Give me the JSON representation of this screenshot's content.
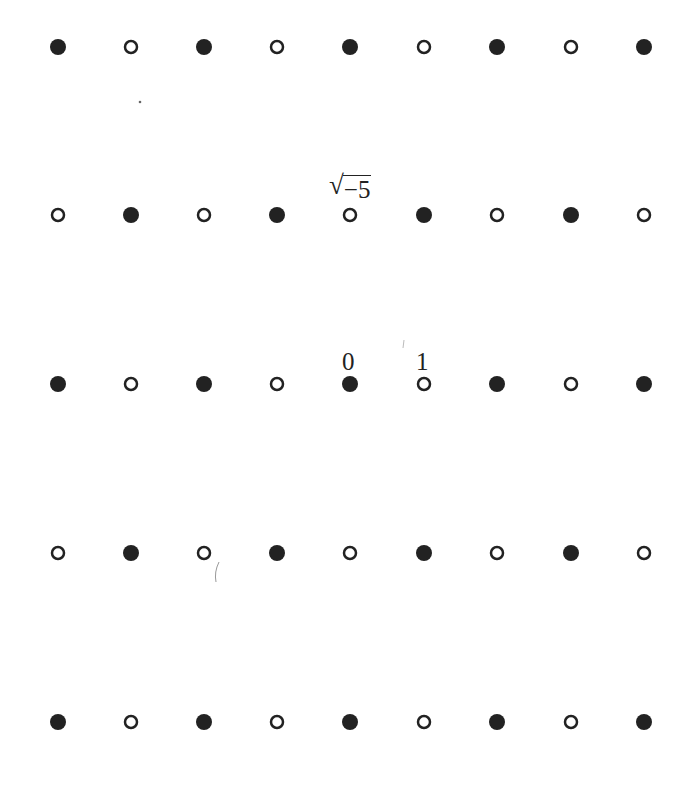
{
  "diagram": {
    "columns_x": [
      58,
      131,
      204,
      277,
      350,
      424,
      497,
      571,
      644
    ],
    "rows_y": [
      47,
      215,
      384,
      553,
      722
    ],
    "rows": [
      [
        "filled",
        "open",
        "filled",
        "open",
        "filled",
        "open",
        "filled",
        "open",
        "filled"
      ],
      [
        "open",
        "filled",
        "open",
        "filled",
        "open",
        "filled",
        "open",
        "filled",
        "open"
      ],
      [
        "filled",
        "open",
        "filled",
        "open",
        "filled",
        "open",
        "filled",
        "open",
        "filled"
      ],
      [
        "open",
        "filled",
        "open",
        "filled",
        "open",
        "filled",
        "open",
        "filled",
        "open"
      ],
      [
        "filled",
        "open",
        "filled",
        "open",
        "filled",
        "open",
        "filled",
        "open",
        "filled"
      ]
    ],
    "dot_style": {
      "filled_radius": 8,
      "open_radius": 6,
      "open_stroke_width": 2.5,
      "color": "#222222"
    },
    "labels": {
      "origin": "0",
      "one": "1",
      "sqrt_symbol": "√",
      "sqrt_radicand": "−5"
    }
  }
}
